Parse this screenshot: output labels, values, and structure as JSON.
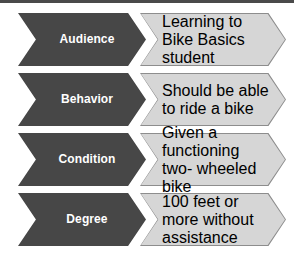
{
  "diagram": {
    "type": "chevron-process-list",
    "colors": {
      "label_fill": "#474747",
      "label_text": "#ffffff",
      "value_fill": "#d6d6d6",
      "value_border": "#8d8d8d",
      "value_text": "#1c1c1c",
      "page_rule": "#4a4a4a",
      "background": "#ffffff"
    },
    "rows": [
      {
        "label": "Audience",
        "value": "Learning to Bike\nBasics student"
      },
      {
        "label": "Behavior",
        "value": "Should be able\nto ride a bike"
      },
      {
        "label": "Condition",
        "value": "Given a\nfunctioning two-\nwheeled bike"
      },
      {
        "label": "Degree",
        "value": "100 feet or more\nwithout\nassistance"
      }
    ]
  }
}
